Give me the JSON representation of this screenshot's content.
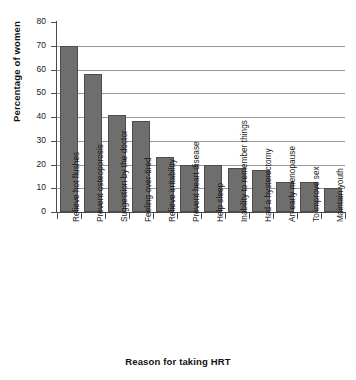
{
  "chart_data": {
    "type": "bar",
    "title": "",
    "xlabel": "Reason for taking HRT",
    "ylabel": "Percentage of women",
    "ylim": [
      0,
      80
    ],
    "ytick_values": [
      0,
      10,
      20,
      30,
      40,
      50,
      60,
      70,
      80
    ],
    "ytick_labels": [
      "0",
      "10",
      "20",
      "30",
      "40",
      "50",
      "60",
      "70",
      "80"
    ],
    "gridlines": [
      10,
      20,
      30,
      40,
      50,
      60,
      70
    ],
    "grid": true,
    "legend": "none",
    "bar_color": "#6e6e6e",
    "bar_edge_color": "#4d4d4d",
    "axis_color": "#4a4a4a",
    "gridline_color": "#9a9a9a",
    "categories": [
      "Relieve hot flushes",
      "Prevent osteoporosis",
      "Suggestion by the doctor",
      "Feeling over-tired",
      "Relieve irritability",
      "Prevent heart disease",
      "Help sleep",
      "Inability to remember things",
      "Had a hysterectomy",
      "An early menopause",
      "To improve sex",
      "Maintain youth"
    ],
    "values": [
      70,
      58,
      41,
      38.5,
      23,
      20,
      20,
      18.5,
      17.5,
      12.5,
      12.7,
      10
    ]
  }
}
